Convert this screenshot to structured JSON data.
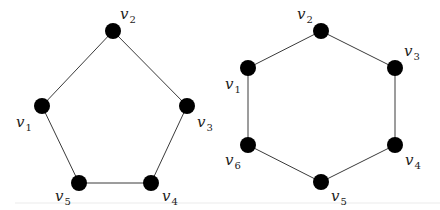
{
  "diagram": {
    "type": "graph",
    "graphs": [
      {
        "name": "pentagon",
        "description": "Cycle graph C5",
        "vertices": [
          {
            "id": "v1",
            "letter": "v",
            "index": "1",
            "x": 42,
            "y": 106,
            "lx": 16,
            "ly": 127
          },
          {
            "id": "v2",
            "letter": "v",
            "index": "2",
            "x": 113,
            "y": 31,
            "lx": 120,
            "ly": 19
          },
          {
            "id": "v3",
            "letter": "v",
            "index": "3",
            "x": 187,
            "y": 106,
            "lx": 197,
            "ly": 127
          },
          {
            "id": "v4",
            "letter": "v",
            "index": "4",
            "x": 151,
            "y": 183,
            "lx": 162,
            "ly": 201
          },
          {
            "id": "v5",
            "letter": "v",
            "index": "5",
            "x": 79,
            "y": 183,
            "lx": 55,
            "ly": 201
          }
        ],
        "edges": [
          [
            "v1",
            "v2"
          ],
          [
            "v2",
            "v3"
          ],
          [
            "v3",
            "v4"
          ],
          [
            "v4",
            "v5"
          ],
          [
            "v5",
            "v1"
          ]
        ]
      },
      {
        "name": "hexagon",
        "description": "Cycle graph C6",
        "vertices": [
          {
            "id": "v1",
            "letter": "v",
            "index": "1",
            "x": 248,
            "y": 68,
            "lx": 225,
            "ly": 89
          },
          {
            "id": "v2",
            "letter": "v",
            "index": "2",
            "x": 321,
            "y": 31,
            "lx": 297,
            "ly": 19
          },
          {
            "id": "v3",
            "letter": "v",
            "index": "3",
            "x": 395,
            "y": 68,
            "lx": 404,
            "ly": 56
          },
          {
            "id": "v4",
            "letter": "v",
            "index": "4",
            "x": 395,
            "y": 145,
            "lx": 405,
            "ly": 165
          },
          {
            "id": "v5",
            "letter": "v",
            "index": "5",
            "x": 321,
            "y": 182,
            "lx": 331,
            "ly": 201
          },
          {
            "id": "v6",
            "letter": "v",
            "index": "6",
            "x": 248,
            "y": 145,
            "lx": 225,
            "ly": 165
          }
        ],
        "edges": [
          [
            "v1",
            "v2"
          ],
          [
            "v2",
            "v3"
          ],
          [
            "v3",
            "v4"
          ],
          [
            "v4",
            "v5"
          ],
          [
            "v5",
            "v6"
          ],
          [
            "v6",
            "v1"
          ]
        ]
      }
    ],
    "style": {
      "vertex_color": "#000000",
      "edge_color": "#3a3a3a",
      "label_color": "#222222",
      "vertex_radius": 8
    }
  }
}
